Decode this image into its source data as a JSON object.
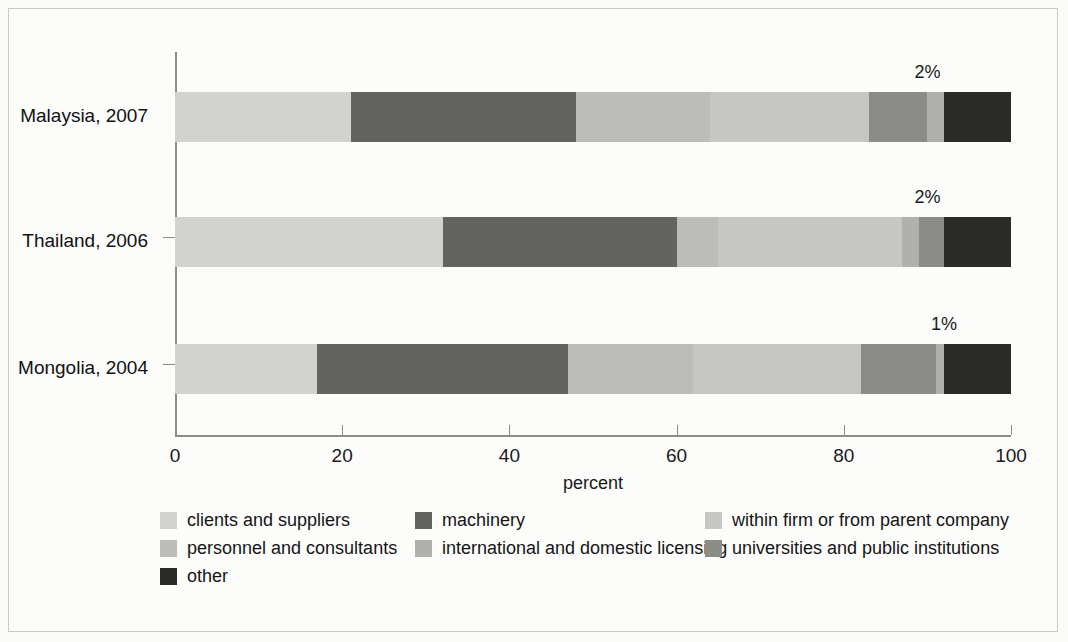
{
  "figure": {
    "x_axis_title": "percent",
    "x_ticks": [
      0,
      20,
      40,
      60,
      80,
      100
    ],
    "categories": [
      "Malaysia, 2007",
      "Thailand, 2006",
      "Mongolia, 2004"
    ]
  },
  "colors": {
    "clients_and_suppliers": "#d2d2d0",
    "machinery": "#63635f",
    "personnel_and_consultants": "#bcbcba",
    "international_and_domestic_licensing": "#b0b0ad",
    "within_firm_or_from_parent_company": "#c6c6c3",
    "universities_and_public_institutions": "#8b8b87",
    "other": "#2a2a28",
    "axis": "#8c8c8a",
    "text": "#1a1a1a",
    "background": "#fcfcfb"
  },
  "legend": {
    "row1": [
      {
        "label": "clients and suppliers",
        "color_key": "clients_and_suppliers"
      },
      {
        "label": "machinery",
        "color_key": "machinery"
      },
      {
        "label": "within firm or from parent company",
        "color_key": "within_firm_or_from_parent_company"
      }
    ],
    "row2": [
      {
        "label": "personnel and consultants",
        "color_key": "personnel_and_consultants"
      },
      {
        "label": "international and domestic licensing",
        "color_key": "international_and_domestic_licensing"
      },
      {
        "label": "universities and public institutions",
        "color_key": "universities_and_public_institutions"
      }
    ],
    "row3": [
      {
        "label": "other",
        "color_key": "other"
      }
    ]
  },
  "callouts": [
    {
      "text": "2%",
      "category": "Malaysia, 2007",
      "at_percent": 90
    },
    {
      "text": "2%",
      "category": "Thailand, 2006",
      "at_percent": 90
    },
    {
      "text": "1%",
      "category": "Mongolia, 2004",
      "at_percent": 92
    }
  ],
  "chart_data": {
    "type": "bar",
    "orientation": "horizontal",
    "stacked": true,
    "stack_total": 100,
    "title": "",
    "subtitle": "",
    "xlabel": "percent",
    "ylabel": "",
    "xlim": [
      0,
      100
    ],
    "xticks": [
      0,
      20,
      40,
      60,
      80,
      100
    ],
    "grid": false,
    "legend_position": "bottom",
    "categories": [
      "Malaysia, 2007",
      "Thailand, 2006",
      "Mongolia, 2004"
    ],
    "series": [
      {
        "name": "clients and suppliers",
        "color": "#d2d2d0",
        "values": [
          21,
          32,
          17
        ]
      },
      {
        "name": "machinery",
        "color": "#63635f",
        "values": [
          27,
          28,
          30
        ]
      },
      {
        "name": "personnel and consultants",
        "color": "#bcbcba",
        "values": [
          16,
          5,
          15
        ]
      },
      {
        "name": "within firm or from parent company",
        "color": "#c6c6c3",
        "values": [
          19,
          22,
          20
        ]
      },
      {
        "name": "universities and public institutions",
        "color": "#8b8b87",
        "values": [
          7,
          3,
          9
        ]
      },
      {
        "name": "international and domestic licensing",
        "color": "#b0b0ad",
        "values": [
          2,
          2,
          1
        ]
      },
      {
        "name": "other",
        "color": "#2a2a28",
        "values": [
          8,
          8,
          8
        ]
      }
    ],
    "stack_order": [
      "clients and suppliers",
      "machinery",
      "personnel and consultants",
      "within firm or from parent company",
      "universities and public institutions",
      "international and domestic licensing",
      "other"
    ],
    "annotations": [
      {
        "text": "2%",
        "series": "international and domestic licensing",
        "category": "Malaysia, 2007"
      },
      {
        "text": "2%",
        "series": "international and domestic licensing",
        "category": "Thailand, 2006"
      },
      {
        "text": "1%",
        "series": "international and domestic licensing",
        "category": "Mongolia, 2004"
      }
    ],
    "bars": [
      {
        "category": "Malaysia, 2007",
        "segments": [
          {
            "name": "clients and suppliers",
            "value": 21
          },
          {
            "name": "machinery",
            "value": 27
          },
          {
            "name": "personnel and consultants",
            "value": 16
          },
          {
            "name": "within firm or from parent company",
            "value": 19
          },
          {
            "name": "universities and public institutions",
            "value": 7
          },
          {
            "name": "international and domestic licensing",
            "value": 2
          },
          {
            "name": "other",
            "value": 8
          }
        ]
      },
      {
        "category": "Thailand, 2006",
        "segments": [
          {
            "name": "clients and suppliers",
            "value": 32
          },
          {
            "name": "machinery",
            "value": 28
          },
          {
            "name": "personnel and consultants",
            "value": 5
          },
          {
            "name": "within firm or from parent company",
            "value": 22
          },
          {
            "name": "international and domestic licensing",
            "value": 2
          },
          {
            "name": "universities and public institutions",
            "value": 3
          },
          {
            "name": "other",
            "value": 8
          }
        ]
      },
      {
        "category": "Mongolia, 2004",
        "segments": [
          {
            "name": "clients and suppliers",
            "value": 17
          },
          {
            "name": "machinery",
            "value": 30
          },
          {
            "name": "personnel and consultants",
            "value": 15
          },
          {
            "name": "within firm or from parent company",
            "value": 20
          },
          {
            "name": "universities and public institutions",
            "value": 9
          },
          {
            "name": "international and domestic licensing",
            "value": 1
          },
          {
            "name": "other",
            "value": 8
          }
        ]
      }
    ]
  }
}
